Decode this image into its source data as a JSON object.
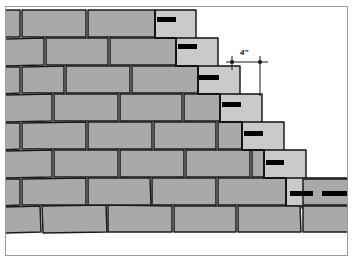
{
  "figure": {
    "frame": {
      "visible": true,
      "color": "#9a9a9a"
    }
  },
  "annotation": {
    "dimension_label": "4\"",
    "dimension_value": 4,
    "dimension_unit": "inch",
    "line_color": "#1a1a1a",
    "x1": 232,
    "x2": 260,
    "y": 62,
    "leader_bottom": 96,
    "label_x": 240,
    "label_y": 49
  },
  "colors": {
    "block_face": "#a9a9a9",
    "block_face_light": "#cacaca",
    "mortar_line": "#1c1c1c",
    "outline": "#111111",
    "reinforcement": "#000000",
    "background": "#ffffff",
    "frame": "#9a9a9a"
  },
  "wall": {
    "description": "Running-bond concrete masonry wall racked back in steps from left (full height) to right (one course).",
    "course_count": 8,
    "ground_line_y": 232,
    "step_direction": "descending-left-to-right"
  },
  "courses": [
    {
      "index": 0,
      "top": 10,
      "bottom": 38,
      "right_end": 176,
      "note": "top course"
    },
    {
      "index": 1,
      "top": 38,
      "bottom": 66,
      "right_end": 198,
      "note": ""
    },
    {
      "index": 2,
      "top": 66,
      "bottom": 94,
      "right_end": 220,
      "note": ""
    },
    {
      "index": 3,
      "top": 94,
      "bottom": 122,
      "right_end": 242,
      "note": ""
    },
    {
      "index": 4,
      "top": 122,
      "bottom": 150,
      "right_end": 264,
      "note": ""
    },
    {
      "index": 5,
      "top": 150,
      "bottom": 178,
      "right_end": 286,
      "note": ""
    },
    {
      "index": 6,
      "top": 178,
      "bottom": 206,
      "right_end": 348,
      "note": "extends to right edge"
    },
    {
      "index": 7,
      "top": 206,
      "bottom": 232,
      "right_end": 348,
      "note": "bottom course on grade"
    }
  ],
  "reinforcement_marks": [
    {
      "id": 1,
      "x": 157,
      "y": 17,
      "width": 19,
      "height": 5
    },
    {
      "id": 2,
      "x": 178,
      "y": 44,
      "width": 19,
      "height": 5
    },
    {
      "id": 3,
      "x": 199,
      "y": 75,
      "width": 20,
      "height": 5
    },
    {
      "id": 4,
      "x": 222,
      "y": 102,
      "width": 19,
      "height": 5
    },
    {
      "id": 5,
      "x": 244,
      "y": 131,
      "width": 19,
      "height": 5
    },
    {
      "id": 6,
      "x": 266,
      "y": 160,
      "width": 18,
      "height": 5
    },
    {
      "id": 7,
      "x": 290,
      "y": 191,
      "width": 23,
      "height": 5
    },
    {
      "id": 8,
      "x": 322,
      "y": 191,
      "width": 26,
      "height": 5
    }
  ],
  "legend": {
    "gray_blocks": "Concrete masonry units (shaded face)",
    "light_blocks": "Stepped end blocks / racked face",
    "black_bars": "Joint reinforcement at stepped courses"
  }
}
